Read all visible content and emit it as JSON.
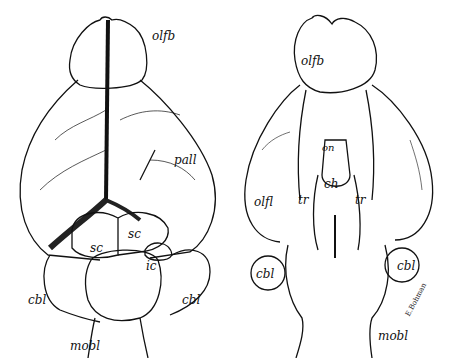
{
  "figure": {
    "type": "brain-anatomy-illustration",
    "views": [
      {
        "id": "dorsal",
        "labels": {
          "olfb": "olfb",
          "pall": "pall",
          "sc_left": "sc",
          "sc_right": "sc",
          "ic": "ic",
          "cbl_left": "cbl",
          "cbl_right": "cbl",
          "mobl": "mobl"
        }
      },
      {
        "id": "ventral",
        "labels": {
          "olfb": "olfb",
          "on": "on",
          "ch": "ch",
          "tr_left": "tr",
          "tr_right": "tr",
          "olfl": "olfl",
          "cbl_left": "cbl",
          "cbl_right": "cbl",
          "mobl": "mobl"
        },
        "signature": "E.Bohman"
      }
    ],
    "colors": {
      "ink": "#111111",
      "background": "#ffffff"
    }
  }
}
